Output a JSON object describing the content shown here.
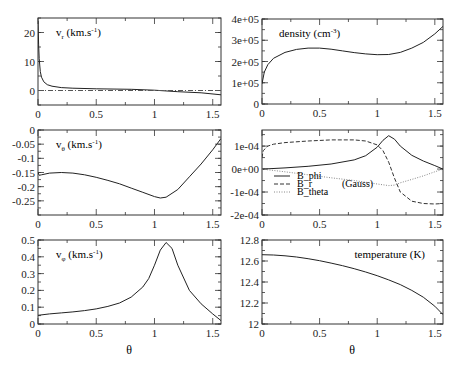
{
  "figure": {
    "xlabel": "θ",
    "xticks": [
      "0",
      "0.5",
      "1",
      "1.5"
    ]
  },
  "chart_data": [
    {
      "id": "vr",
      "type": "line",
      "panel": "top-left",
      "annotation": "v_r (km.s^-1)",
      "label_main": "v",
      "label_sub": "r",
      "label_rest": " (km.s",
      "label_sup": "-1",
      "label_end": ")",
      "xlabel": "",
      "ylabel": "",
      "xlim": [
        0,
        1.571
      ],
      "ylim": [
        -5,
        25
      ],
      "xticks": [
        0,
        0.5,
        1,
        1.5
      ],
      "yticks": [
        0,
        10,
        20
      ],
      "ytick_labels": [
        "0",
        "10",
        "20"
      ],
      "series": [
        {
          "name": "v_r",
          "style": "solid",
          "x": [
            0.0,
            0.005,
            0.01,
            0.02,
            0.03,
            0.05,
            0.08,
            0.12,
            0.2,
            0.3,
            0.5,
            0.8,
            1.0,
            1.2,
            1.4,
            1.571
          ],
          "y": [
            24,
            16,
            11,
            6.5,
            4.6,
            3.0,
            2.0,
            1.5,
            1.0,
            0.8,
            0.6,
            0.4,
            0.1,
            -0.4,
            -0.8,
            -1.5
          ]
        },
        {
          "name": "zero",
          "style": "dashdot",
          "x": [
            0,
            1.571
          ],
          "y": [
            0,
            0
          ]
        }
      ]
    },
    {
      "id": "density",
      "type": "line",
      "panel": "top-right",
      "annotation": "density (cm^-3)",
      "label_main": "density (cm",
      "label_sup": "-3",
      "label_end": ")",
      "xlim": [
        0,
        1.571
      ],
      "ylim": [
        0,
        400000
      ],
      "xticks": [
        0,
        0.5,
        1,
        1.5
      ],
      "yticks": [
        0,
        100000,
        200000,
        300000,
        400000
      ],
      "ytick_labels": [
        "0",
        "1e+05",
        "2e+05",
        "3e+05",
        "4e+05"
      ],
      "series": [
        {
          "name": "density",
          "style": "solid",
          "x": [
            0.0,
            0.02,
            0.05,
            0.1,
            0.2,
            0.3,
            0.4,
            0.5,
            0.6,
            0.7,
            0.8,
            0.9,
            1.0,
            1.1,
            1.2,
            1.3,
            1.4,
            1.5,
            1.571
          ],
          "y": [
            95000,
            150000,
            185000,
            215000,
            243000,
            257000,
            263000,
            263000,
            258000,
            250000,
            242000,
            236000,
            232000,
            233000,
            243000,
            263000,
            290000,
            330000,
            365000
          ]
        }
      ]
    },
    {
      "id": "vtheta",
      "type": "line",
      "panel": "middle-left",
      "annotation": "v_θ (km.s^-1)",
      "label_main": "v",
      "label_sub": "θ",
      "label_rest": " (km.s",
      "label_sup": "-1",
      "label_end": ")",
      "xlim": [
        0,
        1.571
      ],
      "ylim": [
        -0.3,
        0
      ],
      "xticks": [
        0,
        0.5,
        1,
        1.5
      ],
      "yticks": [
        0,
        -0.05,
        -0.1,
        -0.15,
        -0.2,
        -0.25
      ],
      "ytick_labels": [
        "0",
        "-0.05",
        "-0.1",
        "-0.15",
        "-0.2",
        "-0.25"
      ],
      "series": [
        {
          "name": "v_theta",
          "style": "solid",
          "x": [
            0.0,
            0.01,
            0.03,
            0.1,
            0.2,
            0.3,
            0.4,
            0.5,
            0.6,
            0.7,
            0.8,
            0.9,
            1.0,
            1.05,
            1.1,
            1.2,
            1.3,
            1.4,
            1.5,
            1.571
          ],
          "y": [
            -0.15,
            -0.16,
            -0.158,
            -0.152,
            -0.15,
            -0.152,
            -0.158,
            -0.167,
            -0.178,
            -0.19,
            -0.205,
            -0.22,
            -0.235,
            -0.24,
            -0.237,
            -0.21,
            -0.165,
            -0.12,
            -0.07,
            -0.03
          ]
        }
      ]
    },
    {
      "id": "bfield",
      "type": "line",
      "panel": "middle-right",
      "annotation": "(Gauss)",
      "xlim": [
        0,
        1.571
      ],
      "ylim": [
        -0.0002,
        0.00017
      ],
      "xticks": [
        0,
        0.5,
        1,
        1.5
      ],
      "yticks": [
        0.0001,
        0,
        -0.0001,
        -0.0002
      ],
      "ytick_labels": [
        "1e-04",
        "0e+00",
        "-1e-04",
        "-2e-04"
      ],
      "legend": [
        "B_phi",
        "B_r",
        "B_theta"
      ],
      "legend_position": "lower-left",
      "series": [
        {
          "name": "B_phi",
          "style": "solid",
          "x": [
            0.0,
            0.2,
            0.4,
            0.6,
            0.8,
            0.9,
            1.0,
            1.05,
            1.1,
            1.15,
            1.2,
            1.3,
            1.4,
            1.5,
            1.571
          ],
          "y": [
            0.0,
            5e-06,
            1.2e-05,
            2.2e-05,
            4e-05,
            5.8e-05,
            9.5e-05,
            0.000125,
            0.000145,
            0.00013,
            0.0001,
            6e-05,
            3.5e-05,
            1.5e-05,
            0.0
          ]
        },
        {
          "name": "B_r",
          "style": "dashed",
          "x": [
            0.0,
            0.01,
            0.05,
            0.1,
            0.2,
            0.4,
            0.6,
            0.8,
            0.9,
            1.0,
            1.05,
            1.1,
            1.15,
            1.2,
            1.3,
            1.4,
            1.5,
            1.571
          ],
          "y": [
            5e-05,
            8e-05,
            0.0001,
            0.000108,
            0.000115,
            0.000122,
            0.000127,
            0.000127,
            0.000122,
            0.000105,
            8e-05,
            3e-05,
            -4e-05,
            -0.0001,
            -0.00014,
            -0.00015,
            -0.000152,
            -0.00015
          ]
        },
        {
          "name": "B_theta",
          "style": "dotted",
          "x": [
            0.0,
            0.2,
            0.4,
            0.6,
            0.8,
            1.0,
            1.1,
            1.15,
            1.2,
            1.3,
            1.4,
            1.5,
            1.571
          ],
          "y": [
            0.0,
            -1.2e-05,
            -2.5e-05,
            -3.8e-05,
            -5e-05,
            -6.5e-05,
            -7.2e-05,
            -7e-05,
            -6e-05,
            -4.5e-05,
            -3e-05,
            -1.2e-05,
            0.0
          ]
        }
      ]
    },
    {
      "id": "vphi",
      "type": "line",
      "panel": "bottom-left",
      "annotation": "v_φ (km.s^-1)",
      "label_main": "v",
      "label_sub": "φ",
      "label_rest": " (km.s",
      "label_sup": "-1",
      "label_end": ")",
      "xlim": [
        0,
        1.571
      ],
      "ylim": [
        0,
        0.5
      ],
      "xticks": [
        0,
        0.5,
        1,
        1.5
      ],
      "yticks": [
        0,
        0.1,
        0.2,
        0.3,
        0.4,
        0.5
      ],
      "ytick_labels": [
        "0",
        "0.1",
        "0.2",
        "0.3",
        "0.4",
        "0.5"
      ],
      "xlabel": "θ",
      "series": [
        {
          "name": "v_phi",
          "style": "solid",
          "x": [
            0.0,
            0.1,
            0.2,
            0.3,
            0.4,
            0.5,
            0.6,
            0.7,
            0.8,
            0.9,
            0.95,
            1.0,
            1.05,
            1.1,
            1.15,
            1.2,
            1.3,
            1.4,
            1.5,
            1.571
          ],
          "y": [
            0.052,
            0.06,
            0.066,
            0.072,
            0.08,
            0.09,
            0.105,
            0.125,
            0.16,
            0.22,
            0.27,
            0.35,
            0.44,
            0.485,
            0.45,
            0.35,
            0.2,
            0.12,
            0.06,
            0.02
          ]
        }
      ]
    },
    {
      "id": "temperature",
      "type": "line",
      "panel": "bottom-right",
      "annotation": "temperature (K)",
      "label_main": "temperature (K)",
      "xlim": [
        0,
        1.571
      ],
      "ylim": [
        12,
        12.8
      ],
      "xticks": [
        0,
        0.5,
        1,
        1.5
      ],
      "yticks": [
        12,
        12.2,
        12.4,
        12.6,
        12.8
      ],
      "ytick_labels": [
        "12",
        "12.2",
        "12.4",
        "12.6",
        "12.8"
      ],
      "xlabel": "θ",
      "series": [
        {
          "name": "temperature",
          "style": "solid",
          "x": [
            0.0,
            0.1,
            0.2,
            0.3,
            0.4,
            0.5,
            0.6,
            0.7,
            0.8,
            0.9,
            1.0,
            1.1,
            1.2,
            1.3,
            1.4,
            1.5,
            1.571
          ],
          "y": [
            12.66,
            12.657,
            12.65,
            12.638,
            12.622,
            12.603,
            12.58,
            12.555,
            12.527,
            12.495,
            12.46,
            12.42,
            12.375,
            12.32,
            12.255,
            12.17,
            12.09
          ]
        }
      ]
    }
  ]
}
